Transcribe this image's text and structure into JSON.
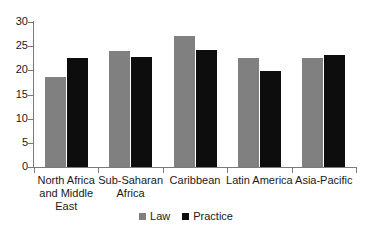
{
  "chart_data": {
    "type": "bar",
    "title": "",
    "subtitle": "",
    "xlabel": "",
    "ylabel": "",
    "ylim": [
      0,
      30
    ],
    "ytick_labels": [
      "30",
      "25",
      "20",
      "15",
      "10",
      "5",
      "0"
    ],
    "ytick_values": [
      30,
      25,
      20,
      15,
      10,
      5,
      0
    ],
    "grid": false,
    "legend_position": "bottom",
    "categories": [
      "North Africa and Middle East",
      "Sub-Saharan Africa",
      "Caribbean",
      "Latin America",
      "Asia-Pacific"
    ],
    "category_lines": [
      [
        "North Africa",
        "and Middle",
        "East"
      ],
      [
        "Sub-Saharan",
        "Africa"
      ],
      [
        "Caribbean"
      ],
      [
        "Latin America"
      ],
      [
        "Asia-Pacific"
      ]
    ],
    "series": [
      {
        "name": "Law",
        "color": "#808080",
        "values": [
          18.7,
          24.0,
          27.1,
          22.6,
          22.5
        ]
      },
      {
        "name": "Practice",
        "color": "#0d0d0d",
        "values": [
          22.6,
          22.8,
          24.2,
          19.8,
          23.1
        ]
      }
    ]
  },
  "legend": {
    "items": [
      {
        "label": "Law",
        "color": "#808080"
      },
      {
        "label": "Practice",
        "color": "#0d0d0d"
      }
    ]
  },
  "colors": {
    "axis": "#7a7a7a",
    "text": "#1a1a1a",
    "background": "#ffffff",
    "law": "#808080",
    "practice": "#0d0d0d"
  }
}
